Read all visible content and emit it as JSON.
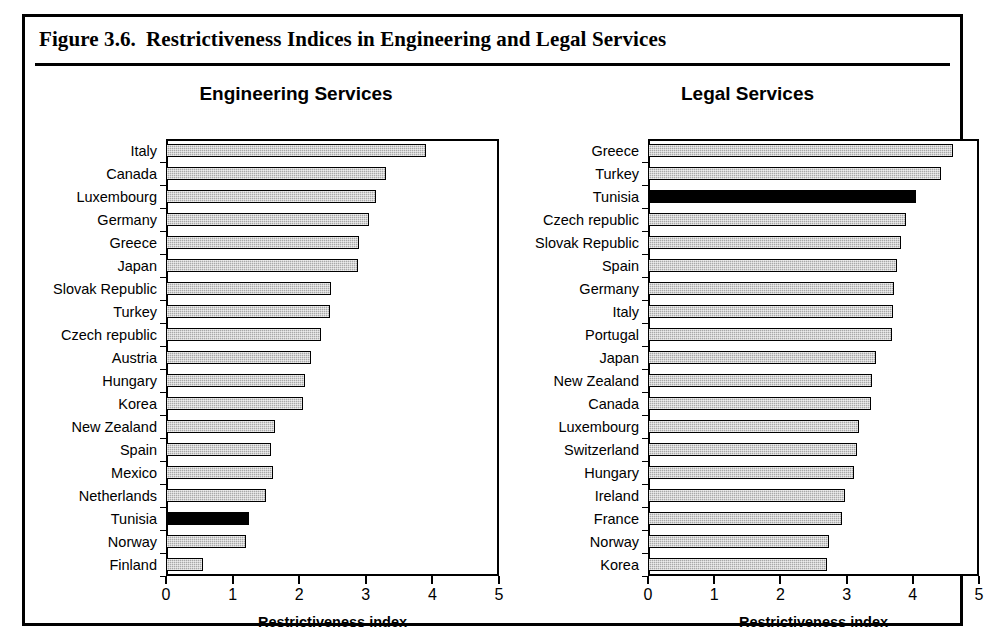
{
  "figure": {
    "number": "Figure 3.6.",
    "title": "Restrictiveness Indices in Engineering and Legal Services"
  },
  "colors": {
    "bar_fill": "#a8a8a8",
    "bar_highlight": "#000000",
    "frame": "#000000"
  },
  "chart_data": [
    {
      "type": "bar",
      "orientation": "horizontal",
      "title": "Engineering Services",
      "xlabel": "Restrictiveness index",
      "ylabel": "",
      "xlim": [
        0,
        5
      ],
      "xticks": [
        0,
        1,
        2,
        3,
        4,
        5
      ],
      "xtick_labels": [
        "0",
        "1",
        "2",
        "3",
        "4",
        "5"
      ],
      "grid": false,
      "legend": "none",
      "highlight_category": "Tunisia",
      "categories": [
        "Italy",
        "Canada",
        "Luxembourg",
        "Germany",
        "Greece",
        "Japan",
        "Slovak Republic",
        "Turkey",
        "Czech republic",
        "Austria",
        "Hungary",
        "Korea",
        "New Zealand",
        "Spain",
        "Mexico",
        "Netherlands",
        "Tunisia",
        "Norway",
        "Finland"
      ],
      "values": [
        3.9,
        3.3,
        3.15,
        3.05,
        2.9,
        2.88,
        2.48,
        2.46,
        2.32,
        2.17,
        2.09,
        2.06,
        1.63,
        1.58,
        1.6,
        1.5,
        1.25,
        1.2,
        0.55
      ]
    },
    {
      "type": "bar",
      "orientation": "horizontal",
      "title": "Legal Services",
      "xlabel": "Restrictiveness index",
      "ylabel": "",
      "xlim": [
        0,
        5
      ],
      "xticks": [
        0,
        1,
        2,
        3,
        4,
        5
      ],
      "xtick_labels": [
        "0",
        "1",
        "2",
        "3",
        "4",
        "5"
      ],
      "grid": false,
      "legend": "none",
      "highlight_category": "Tunisia",
      "categories": [
        "Greece",
        "Turkey",
        "Tunisia",
        "Czech republic",
        "Slovak Republic",
        "Spain",
        "Germany",
        "Italy",
        "Portugal",
        "Japan",
        "New Zealand",
        "Canada",
        "Luxembourg",
        "Switzerland",
        "Hungary",
        "Ireland",
        "France",
        "Norway",
        "Korea"
      ],
      "values": [
        4.6,
        4.43,
        4.05,
        3.9,
        3.82,
        3.76,
        3.72,
        3.7,
        3.68,
        3.44,
        3.39,
        3.37,
        3.19,
        3.16,
        3.11,
        2.97,
        2.93,
        2.74,
        2.71
      ]
    }
  ]
}
